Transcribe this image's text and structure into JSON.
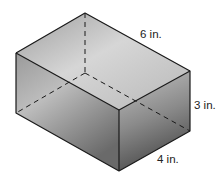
{
  "figure": {
    "type": "rectangular-prism",
    "labels": {
      "length": "6 in.",
      "height": "3 in.",
      "width": "4 in."
    },
    "colors": {
      "edge": "#1a1a1a",
      "top_face_light": "#dcdcdc",
      "top_face_dark": "#a9a9a9",
      "left_face_light": "#bdbdbd",
      "left_face_dark": "#6f6f6f",
      "right_face_light": "#b5b5b5",
      "right_face_dark": "#5e5e5e"
    }
  }
}
